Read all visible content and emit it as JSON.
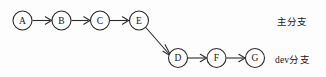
{
  "diagram": {
    "type": "git-branch-commit-graph",
    "background_color": "#fdfdfd",
    "stroke_color": "#2b2b2b",
    "text_color": "#151515",
    "nodes": [
      {
        "id": "A",
        "label": "A",
        "cx": 22.5,
        "cy": 20.5,
        "r": 9.5,
        "branch": "main"
      },
      {
        "id": "B",
        "label": "B",
        "cx": 61.5,
        "cy": 20.5,
        "r": 9.5,
        "branch": "main"
      },
      {
        "id": "C",
        "label": "C",
        "cx": 100.0,
        "cy": 20.5,
        "r": 9.5,
        "branch": "main"
      },
      {
        "id": "E",
        "label": "E",
        "cx": 139.0,
        "cy": 20.5,
        "r": 9.5,
        "branch": "main"
      },
      {
        "id": "D",
        "label": "D",
        "cx": 178.0,
        "cy": 58.0,
        "r": 9.5,
        "branch": "dev"
      },
      {
        "id": "F",
        "label": "F",
        "cx": 216.5,
        "cy": 58.0,
        "r": 9.5,
        "branch": "dev"
      },
      {
        "id": "G",
        "label": "G",
        "cx": 255.0,
        "cy": 58.0,
        "r": 9.5,
        "branch": "dev"
      }
    ],
    "edges": [
      {
        "from": "A",
        "to": "B",
        "kind": "horizontal"
      },
      {
        "from": "B",
        "to": "C",
        "kind": "horizontal"
      },
      {
        "from": "C",
        "to": "E",
        "kind": "horizontal"
      },
      {
        "from": "E",
        "to": "D",
        "kind": "diagonal"
      },
      {
        "from": "D",
        "to": "F",
        "kind": "horizontal"
      },
      {
        "from": "F",
        "to": "G",
        "kind": "horizontal"
      }
    ],
    "branch_labels": {
      "main": "主分支",
      "dev": "dev分支"
    }
  }
}
